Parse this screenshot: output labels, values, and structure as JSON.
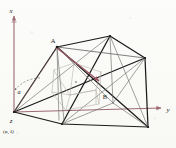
{
  "figure": {
    "kind": "3d-wireframe-geometry-diagram",
    "background_color": "#fbfbf9",
    "axis_color": "#9e6a72",
    "edge_color": "#1a1a1a",
    "thin_edge_color": "#6d6d6d",
    "inner_color": "#b9b4ad",
    "highlight_color": "#9c5560"
  },
  "axes": {
    "x": {
      "label": "x",
      "direction": "up"
    },
    "y": {
      "label": "y",
      "direction": "right"
    },
    "z": {
      "label": "z",
      "direction": "toward-viewer"
    }
  },
  "labels": {
    "point_a": "A",
    "point_b": "B",
    "angle_alpha": "α",
    "origin_coords": "(φ, λ)",
    "origin_axis": "z"
  },
  "points": [
    {
      "name": "A",
      "label": "A",
      "x": 57,
      "y": 47
    },
    {
      "name": "B",
      "label": "B",
      "x": 106,
      "y": 93
    },
    {
      "name": "origin",
      "label": "z",
      "x": 14,
      "y": 112
    }
  ],
  "annotations": {
    "alpha_arc": "α",
    "alpha_desc": "angle between horizontal dashed reference and edge at origin"
  }
}
